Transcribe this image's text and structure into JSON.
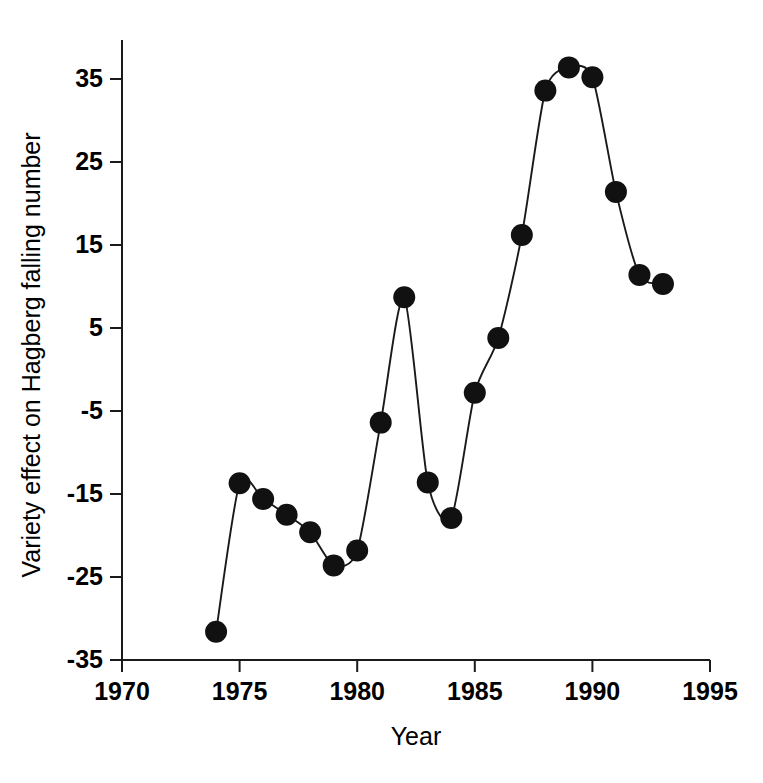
{
  "chart_data": {
    "type": "line",
    "title": "",
    "xlabel": "Year",
    "ylabel": "Variety effect on Hagberg falling number",
    "xlim": [
      1970,
      1995
    ],
    "ylim": [
      -35,
      39
    ],
    "grid": false,
    "legend": "none",
    "marker": "filled-circle",
    "xticks": [
      1970,
      1975,
      1980,
      1985,
      1990,
      1995
    ],
    "xtick_labels": [
      "1970",
      "1975",
      "1980",
      "1985",
      "1990",
      "1995"
    ],
    "yticks": [
      35,
      25,
      15,
      5,
      -5,
      -15,
      -25,
      -35
    ],
    "ytick_labels": [
      "35",
      "25",
      "15",
      "5",
      "-5",
      "-15",
      "-25",
      "-35"
    ],
    "x": [
      1974,
      1975,
      1976,
      1977,
      1978,
      1979,
      1980,
      1981,
      1982,
      1983,
      1984,
      1985,
      1986,
      1987,
      1988,
      1989,
      1990,
      1991,
      1992,
      1993
    ],
    "values": [
      -31.6,
      -13.7,
      -15.6,
      -17.5,
      -19.6,
      -23.6,
      -21.8,
      -6.4,
      8.7,
      -13.6,
      -17.9,
      -2.8,
      3.8,
      16.2,
      33.6,
      36.4,
      35.2,
      21.4,
      11.4,
      10.3
    ],
    "series": [
      {
        "name": "Variety effect on Hagberg falling number",
        "color": "#111111",
        "points": [
          {
            "x": 1974,
            "y": -31.6
          },
          {
            "x": 1975,
            "y": -13.7
          },
          {
            "x": 1976,
            "y": -15.6
          },
          {
            "x": 1977,
            "y": -17.5
          },
          {
            "x": 1978,
            "y": -19.6
          },
          {
            "x": 1979,
            "y": -23.6
          },
          {
            "x": 1980,
            "y": -21.8
          },
          {
            "x": 1981,
            "y": -6.4
          },
          {
            "x": 1982,
            "y": 8.7
          },
          {
            "x": 1983,
            "y": -13.6
          },
          {
            "x": 1984,
            "y": -17.9
          },
          {
            "x": 1985,
            "y": -2.8
          },
          {
            "x": 1986,
            "y": 3.8
          },
          {
            "x": 1987,
            "y": 16.2
          },
          {
            "x": 1988,
            "y": 33.6
          },
          {
            "x": 1989,
            "y": 36.4
          },
          {
            "x": 1990,
            "y": 35.2
          },
          {
            "x": 1991,
            "y": 21.4
          },
          {
            "x": 1992,
            "y": 11.4
          },
          {
            "x": 1993,
            "y": 10.3
          }
        ]
      }
    ]
  },
  "colors": {
    "axis": "#1a1a1a",
    "marker": "#111111",
    "line": "#1a1a1a",
    "background": "#ffffff"
  }
}
